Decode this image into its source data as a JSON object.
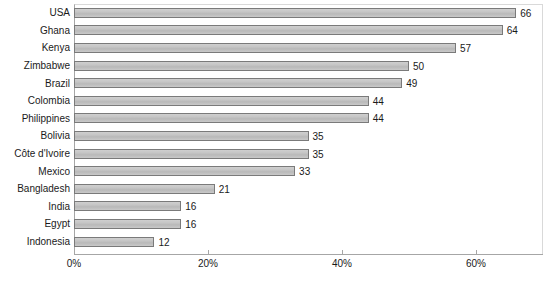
{
  "chart_data": {
    "type": "bar",
    "orientation": "horizontal",
    "title": "",
    "xlabel": "",
    "ylabel": "",
    "xlim": [
      0,
      70
    ],
    "grid": false,
    "legend": "none",
    "xtick_labels": [
      "0%",
      "20%",
      "40%",
      "60%"
    ],
    "xtick_values": [
      0,
      20,
      40,
      60
    ],
    "categories": [
      "USA",
      "Ghana",
      "Kenya",
      "Zimbabwe",
      "Brazil",
      "Colombia",
      "Philippines",
      "Bolivia",
      "Côte d'Ivoire",
      "Mexico",
      "Bangladesh",
      "India",
      "Egypt",
      "Indonesia"
    ],
    "values": [
      66,
      64,
      57,
      50,
      49,
      44,
      44,
      35,
      35,
      33,
      21,
      16,
      16,
      12
    ],
    "value_labels": [
      "66",
      "64",
      "57",
      "50",
      "49",
      "44",
      "44",
      "35",
      "35",
      "33",
      "21",
      "16",
      "16",
      "12"
    ],
    "bars": [
      {
        "category": "USA",
        "value": 66,
        "label": "66"
      },
      {
        "category": "Ghana",
        "value": 64,
        "label": "64"
      },
      {
        "category": "Kenya",
        "value": 57,
        "label": "57"
      },
      {
        "category": "Zimbabwe",
        "value": 50,
        "label": "50"
      },
      {
        "category": "Brazil",
        "value": 49,
        "label": "49"
      },
      {
        "category": "Colombia",
        "value": 44,
        "label": "44"
      },
      {
        "category": "Philippines",
        "value": 44,
        "label": "44"
      },
      {
        "category": "Bolivia",
        "value": 35,
        "label": "35"
      },
      {
        "category": "Côte d'Ivoire",
        "value": 35,
        "label": "35"
      },
      {
        "category": "Mexico",
        "value": 33,
        "label": "33"
      },
      {
        "category": "Bangladesh",
        "value": 21,
        "label": "21"
      },
      {
        "category": "India",
        "value": 16,
        "label": "16"
      },
      {
        "category": "Egypt",
        "value": 16,
        "label": "16"
      },
      {
        "category": "Indonesia",
        "value": 12,
        "label": "12"
      }
    ],
    "colors": {
      "bar_fill": "#c3c3c3",
      "bar_border": "#7a7a7a",
      "background": "#ffffff",
      "axis": "#a6a6a6",
      "text": "#1a1a1a",
      "plot_border": "#d9d9d9"
    }
  }
}
